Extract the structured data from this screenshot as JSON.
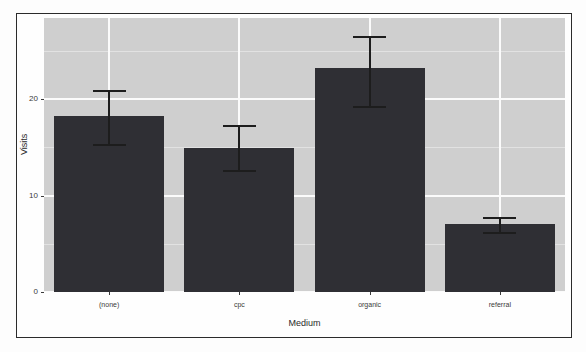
{
  "chart_data": {
    "type": "bar",
    "title": "",
    "xlabel": "Medium",
    "ylabel": "Visits",
    "categories": [
      "(none)",
      "cpc",
      "organic",
      "referral"
    ],
    "values": [
      18.2,
      14.9,
      23.2,
      7.0
    ],
    "errors_low": [
      15.3,
      12.6,
      19.3,
      6.2
    ],
    "errors_high": [
      20.9,
      17.3,
      26.5,
      7.8
    ],
    "ylim": [
      0,
      28.4
    ],
    "yticks": [
      0,
      10,
      20
    ],
    "ytick_labels": [
      "0",
      "10",
      "20"
    ],
    "yminor": [
      5,
      15,
      25
    ],
    "grid": true,
    "legend": "none",
    "series": [
      {
        "name": "Visits",
        "values": [
          18.2,
          14.9,
          23.2,
          7.0
        ]
      }
    ],
    "colors": {
      "bar_fill": "#2f2f34",
      "panel_background": "#cfcfcf",
      "major_gridline": "#fbfbfb",
      "minor_gridline": "#e2e2e2",
      "errorbar": "#1d1d1d",
      "frame_border": "#2b2b2b",
      "axis_text": "#3a3a3a"
    }
  },
  "axis": {
    "x_title": "Medium",
    "y_title": "Visits"
  }
}
